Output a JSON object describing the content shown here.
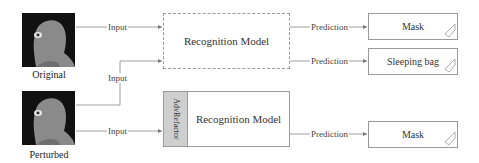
{
  "images": [
    {
      "caption": "Original"
    },
    {
      "caption": "Perturbed"
    }
  ],
  "models": {
    "top": {
      "label": "Recognition Model"
    },
    "bottom": {
      "label": "Recognition Model",
      "prefix_label": "AdvRefactor"
    }
  },
  "edges": {
    "input_label": "Input",
    "prediction_label": "Prediction"
  },
  "outputs": [
    {
      "label": "Mask"
    },
    {
      "label": "Sleeping bag"
    },
    {
      "label": "Mask"
    }
  ],
  "colors": {
    "line": "#888888",
    "adv_fill": "#cfcfcf",
    "face_bg": "#111111",
    "face_fill": "#8a8a8a"
  }
}
